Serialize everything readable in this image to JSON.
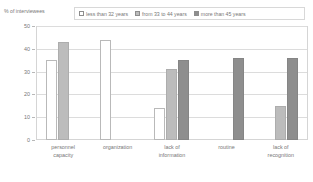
{
  "chart_data": {
    "type": "bar",
    "title": "",
    "ylabel": "% of interviewees",
    "xlabel": "",
    "ylim": [
      0,
      50
    ],
    "yticks": [
      0,
      10,
      20,
      30,
      40,
      50
    ],
    "grid": true,
    "legend_position": "top",
    "categories": [
      "personnel capacity",
      "organization",
      "lack of information",
      "routine",
      "lack of recognition"
    ],
    "series": [
      {
        "name": "less than 32 years",
        "color": "#ffffff",
        "values": [
          35,
          44,
          14,
          null,
          null
        ]
      },
      {
        "name": "from 33 to 44 years",
        "color": "#bcbcbc",
        "values": [
          43,
          null,
          31,
          null,
          15
        ]
      },
      {
        "name": "more than 45 years",
        "color": "#8e8e8e",
        "values": [
          null,
          null,
          35,
          36,
          36
        ]
      }
    ]
  },
  "legend": {
    "items": [
      {
        "label": "less than 32 years"
      },
      {
        "label": "from 33 to 44 years"
      },
      {
        "label": "more than 45 years"
      }
    ]
  },
  "axis": {
    "y_title": "% of interviewees",
    "ticks": [
      "50",
      "40",
      "30",
      "20",
      "10",
      "0"
    ]
  },
  "categories": [
    {
      "line1": "personnel",
      "line2": "capacity"
    },
    {
      "line1": "organization",
      "line2": ""
    },
    {
      "line1": "lack of",
      "line2": "information"
    },
    {
      "line1": "routine",
      "line2": ""
    },
    {
      "line1": "lack of",
      "line2": "recognition"
    }
  ]
}
